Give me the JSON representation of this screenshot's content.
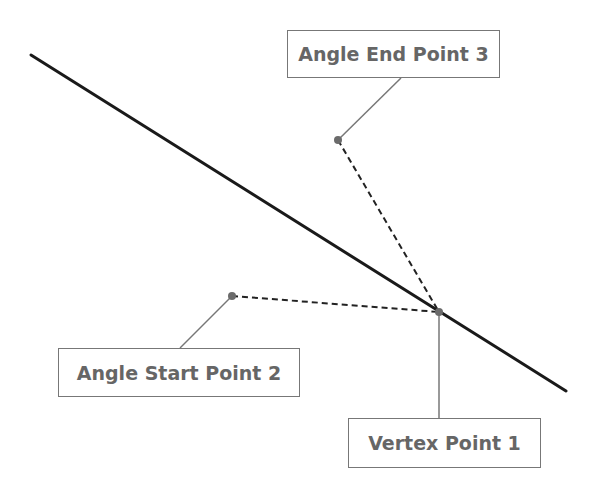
{
  "diagram": {
    "type": "angle-measurement-illustration",
    "labels": {
      "end_point": "Angle End Point 3",
      "start_point": "Angle Start Point 2",
      "vertex": "Vertex Point 1"
    },
    "points": {
      "vertex": {
        "x": 439,
        "y": 312
      },
      "start": {
        "x": 232,
        "y": 296
      },
      "end": {
        "x": 338,
        "y": 140
      }
    },
    "reference_line": {
      "x1": 31,
      "y1": 55,
      "x2": 566,
      "y2": 391
    },
    "colors": {
      "line": "#1a1a1a",
      "leader": "#777777",
      "point": "#6b6b6b",
      "label_text": "#666666",
      "label_border": "#777777"
    }
  }
}
